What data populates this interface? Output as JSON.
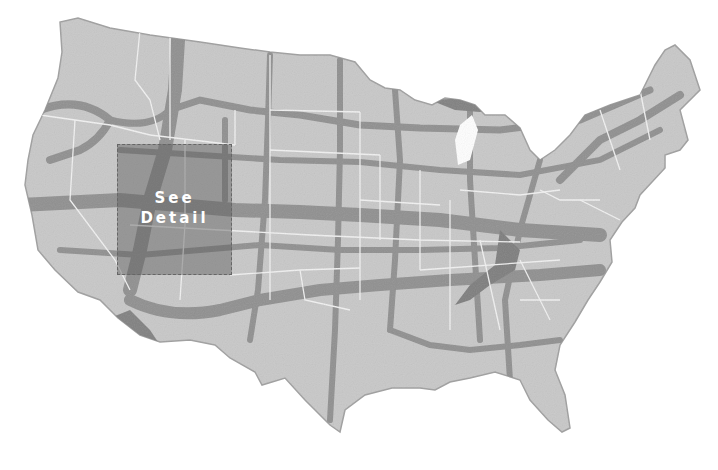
{
  "title_fragment": "",
  "map": {
    "type": "us-corridor-map",
    "colors": {
      "land": "#c8c8c8",
      "corridor": "#8f8f8f",
      "corridor_dark": "#7a7a7a",
      "state_border": "#f2f2f2",
      "background": "#ffffff",
      "detail_overlay": "#5a5a5a"
    }
  },
  "detail_box": {
    "line1": "See",
    "line2": "Detail"
  }
}
